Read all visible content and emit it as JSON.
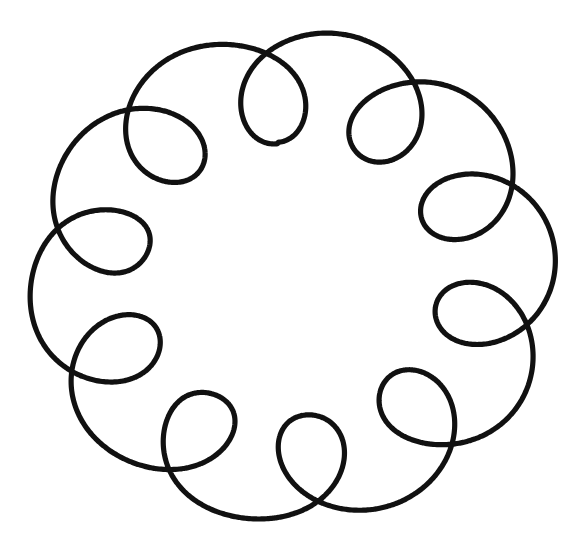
{
  "figure": {
    "canvas": {
      "width": 578,
      "height": 550,
      "background_color": "#ffffff"
    },
    "stroke": {
      "color": "#111111",
      "width": 5.2,
      "style": "solid",
      "linecap": "round"
    }
  },
  "chart_data": {
    "type": "line",
    "xlabel": "",
    "ylabel": "",
    "grid": false,
    "legend": "none",
    "xlim": [
      0,
      578
    ],
    "ylim": [
      0,
      550
    ],
    "curve": {
      "family": "epitrochoid",
      "closed": true,
      "loop_count": 11,
      "center": {
        "x": 292,
        "y": 277
      },
      "envelope_radius_x": 264,
      "envelope_radius_y": 247,
      "loop_radius": 57,
      "loop_center_radius": 196,
      "rotation_deg": -96,
      "hand_drawn_jitter": 3.0
    },
    "loops": [
      {
        "index": 1,
        "angle_deg": -96,
        "cx": 313,
        "cy": 88,
        "rx": 59,
        "ry": 56
      },
      {
        "index": 2,
        "angle_deg": -63,
        "cx": 215,
        "cy": 108,
        "rx": 56,
        "ry": 58
      },
      {
        "index": 3,
        "angle_deg": -30,
        "cx": 137,
        "cy": 172,
        "rx": 57,
        "ry": 57
      },
      {
        "index": 4,
        "angle_deg": 3,
        "cx": 98,
        "cy": 250,
        "rx": 55,
        "ry": 55
      },
      {
        "index": 5,
        "angle_deg": 36,
        "cx": 108,
        "cy": 375,
        "rx": 56,
        "ry": 55
      },
      {
        "index": 6,
        "angle_deg": 69,
        "cx": 168,
        "cy": 468,
        "rx": 58,
        "ry": 57
      },
      {
        "index": 7,
        "angle_deg": 102,
        "cx": 290,
        "cy": 492,
        "rx": 56,
        "ry": 55
      },
      {
        "index": 8,
        "angle_deg": 135,
        "cx": 410,
        "cy": 442,
        "rx": 59,
        "ry": 58
      },
      {
        "index": 9,
        "angle_deg": 168,
        "cx": 470,
        "cy": 352,
        "rx": 57,
        "ry": 57
      },
      {
        "index": 10,
        "angle_deg": 201,
        "cx": 481,
        "cy": 242,
        "rx": 58,
        "ry": 57
      },
      {
        "index": 11,
        "angle_deg": 234,
        "cx": 420,
        "cy": 140,
        "rx": 57,
        "ry": 56
      }
    ],
    "envelope_extents": {
      "left_x": 28,
      "right_x": 556,
      "top_y": 33,
      "bottom_y": 525
    }
  }
}
